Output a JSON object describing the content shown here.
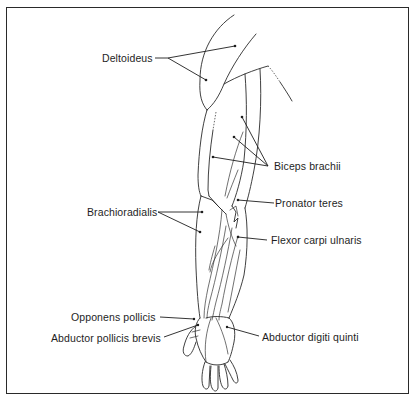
{
  "figure": {
    "colors": {
      "line": "#2a2a2a",
      "text": "#1e1e1e",
      "background": "#ffffff"
    },
    "labels": [
      {
        "id": "deltoideus",
        "text": "Deltoideus"
      },
      {
        "id": "biceps_brachii",
        "text": "Biceps brachii"
      },
      {
        "id": "pronator_teres",
        "text": "Pronator teres"
      },
      {
        "id": "brachioradialis",
        "text": "Brachioradialis"
      },
      {
        "id": "flexor_carpi_ulnaris",
        "text": "Flexor carpi ulnaris"
      },
      {
        "id": "opponens_pollicis",
        "text": "Opponens pollicis"
      },
      {
        "id": "abductor_pollicis_brevis",
        "text": "Abductor pollicis brevis"
      },
      {
        "id": "abductor_digiti_quinti",
        "text": "Abductor digiti quinti"
      }
    ]
  }
}
